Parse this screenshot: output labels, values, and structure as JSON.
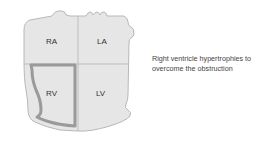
{
  "diagram": {
    "chambers": [
      {
        "id": "RA",
        "label": "RA"
      },
      {
        "id": "LA",
        "label": "LA"
      },
      {
        "id": "RV",
        "label": "RV",
        "highlighted": true
      },
      {
        "id": "LV",
        "label": "LV"
      }
    ],
    "caption": "Right ventricle hypertrophies to overcome the obstruction",
    "colors": {
      "chamber_fill": "#e6e6e6",
      "outline": "#b8b8b8",
      "divider": "#bdbdbd",
      "rv_thick_wall": "#9a9a9a"
    }
  }
}
